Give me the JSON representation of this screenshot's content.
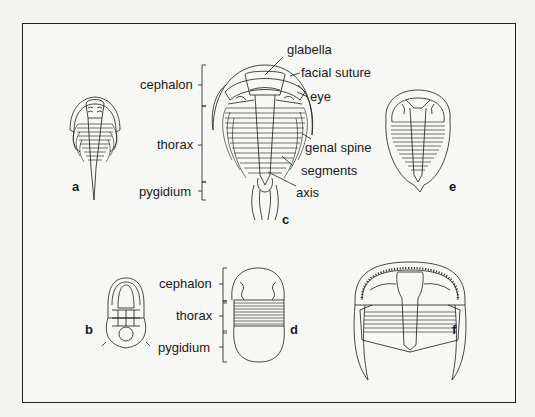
{
  "figure": {
    "figures": [
      {
        "id": "a",
        "letter": "a"
      },
      {
        "id": "b",
        "letter": "b"
      },
      {
        "id": "c",
        "letter": "c"
      },
      {
        "id": "d",
        "letter": "d"
      },
      {
        "id": "e",
        "letter": "e"
      },
      {
        "id": "f",
        "letter": "f"
      }
    ],
    "fig_c": {
      "body_regions": {
        "cephalon": "cephalon",
        "thorax": "thorax",
        "pygidium": "pygidium"
      },
      "annotations": {
        "glabella": "glabella",
        "facial_suture": "facial suture",
        "eye": "eye",
        "genal_spine": "genal spine",
        "segments": "segments",
        "axis": "axis"
      }
    },
    "fig_d": {
      "body_regions": {
        "cephalon": "cephalon",
        "thorax": "thorax",
        "pygidium": "pygidium"
      }
    },
    "colors": {
      "line": "#1a1a1a",
      "background": "#f7f7f5",
      "border": "#222222"
    }
  }
}
